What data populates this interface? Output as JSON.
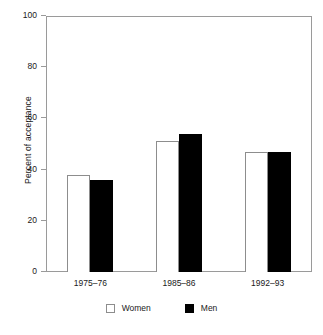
{
  "chart_data": {
    "type": "bar",
    "title": "",
    "xlabel": "",
    "ylabel": "Percent of acceptance",
    "categories": [
      "1975–76",
      "1985–86",
      "1992–93"
    ],
    "series": [
      {
        "name": "Women",
        "values": [
          38,
          51,
          47
        ],
        "color": "#ffffff",
        "border_color": "#8d8d8d"
      },
      {
        "name": "Men",
        "values": [
          36,
          54,
          47
        ],
        "color": "#000000",
        "border_color": "#000000"
      }
    ],
    "ylim": [
      0,
      100
    ],
    "ytick_values": [
      0,
      20,
      40,
      60,
      80,
      100
    ],
    "ytick_labels": [
      "0",
      "20",
      "40",
      "60",
      "80",
      "100"
    ],
    "grid": false,
    "legend_position": "bottom",
    "frame": true
  },
  "legend": {
    "items": [
      {
        "label": "Women",
        "swatch": "women-swatch"
      },
      {
        "label": "Men",
        "swatch": "men-swatch"
      }
    ]
  },
  "colors": {
    "background": "#ffffff",
    "axis": "#9a9a9a",
    "text": "#1a1a1a",
    "women_fill": "#ffffff",
    "women_stroke": "#8d8d8d",
    "men_fill": "#000000"
  }
}
